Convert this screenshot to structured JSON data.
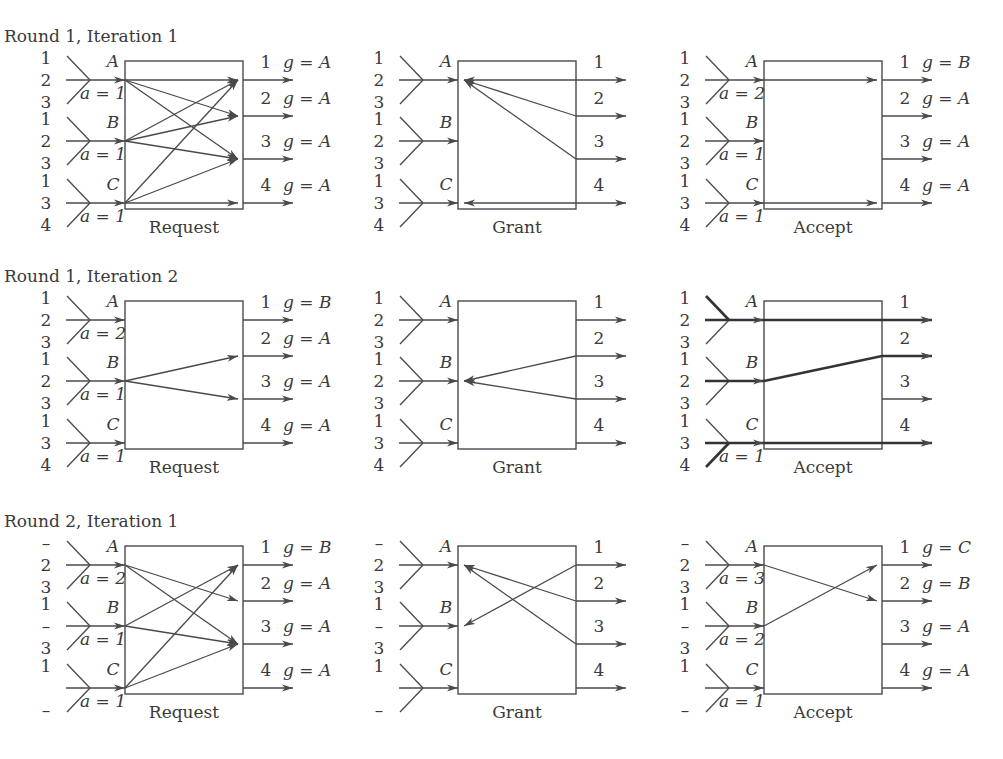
{
  "figure": {
    "colors": {
      "line": "#4a4a4a",
      "text": "#3a3a3a",
      "background": "#ffffff"
    },
    "layout": {
      "columns_x": [
        0,
        333,
        639
      ],
      "rows_y": [
        0,
        240,
        487
      ]
    },
    "rows": [
      {
        "title": "Round 1, Iteration 1",
        "panels": [
          {
            "caption": "Request",
            "inputs": [
              {
                "name": "A",
                "queues": [
                  "1",
                  "2",
                  "3"
                ],
                "a": "a = 1",
                "bold_branch": null
              },
              {
                "name": "B",
                "queues": [
                  "1",
                  "2",
                  "3"
                ],
                "a": "a = 1",
                "bold_branch": null
              },
              {
                "name": "C",
                "queues": [
                  "1",
                  "3",
                  "4"
                ],
                "a": "a = 1",
                "bold_branch": null
              }
            ],
            "outputs": [
              {
                "name": "1",
                "g": "g = A"
              },
              {
                "name": "2",
                "g": "g = A"
              },
              {
                "name": "3",
                "g": "g = A"
              },
              {
                "name": "4",
                "g": "g = A"
              }
            ],
            "edges": [
              {
                "from": "A",
                "to": "1",
                "dir": "in-out"
              },
              {
                "from": "A",
                "to": "2",
                "dir": "in-out"
              },
              {
                "from": "A",
                "to": "3",
                "dir": "in-out"
              },
              {
                "from": "B",
                "to": "1",
                "dir": "in-out"
              },
              {
                "from": "B",
                "to": "2",
                "dir": "in-out"
              },
              {
                "from": "B",
                "to": "3",
                "dir": "in-out"
              },
              {
                "from": "C",
                "to": "1",
                "dir": "in-out"
              },
              {
                "from": "C",
                "to": "3",
                "dir": "in-out"
              },
              {
                "from": "C",
                "to": "4",
                "dir": "in-out"
              }
            ]
          },
          {
            "caption": "Grant",
            "inputs": [
              {
                "name": "A",
                "queues": [
                  "1",
                  "2",
                  "3"
                ],
                "a": "",
                "bold_branch": null
              },
              {
                "name": "B",
                "queues": [
                  "1",
                  "2",
                  "3"
                ],
                "a": "",
                "bold_branch": null
              },
              {
                "name": "C",
                "queues": [
                  "1",
                  "3",
                  "4"
                ],
                "a": "",
                "bold_branch": null
              }
            ],
            "outputs": [
              {
                "name": "1",
                "g": ""
              },
              {
                "name": "2",
                "g": ""
              },
              {
                "name": "3",
                "g": ""
              },
              {
                "name": "4",
                "g": ""
              }
            ],
            "edges": [
              {
                "from": "1",
                "to": "A",
                "dir": "out-in"
              },
              {
                "from": "2",
                "to": "A",
                "dir": "out-in"
              },
              {
                "from": "3",
                "to": "A",
                "dir": "out-in"
              },
              {
                "from": "4",
                "to": "C",
                "dir": "out-in"
              }
            ]
          },
          {
            "caption": "Accept",
            "inputs": [
              {
                "name": "A",
                "queues": [
                  "1",
                  "2",
                  "3"
                ],
                "a": "a = 2",
                "bold_branch": null
              },
              {
                "name": "B",
                "queues": [
                  "1",
                  "2",
                  "3"
                ],
                "a": "a = 1",
                "bold_branch": null
              },
              {
                "name": "C",
                "queues": [
                  "1",
                  "3",
                  "4"
                ],
                "a": "a = 1",
                "bold_branch": null
              }
            ],
            "outputs": [
              {
                "name": "1",
                "g": "g = B"
              },
              {
                "name": "2",
                "g": "g = A"
              },
              {
                "name": "3",
                "g": "g = A"
              },
              {
                "name": "4",
                "g": "g = A"
              }
            ],
            "edges": [
              {
                "from": "A",
                "to": "1",
                "dir": "in-out"
              },
              {
                "from": "C",
                "to": "4",
                "dir": "in-out"
              }
            ]
          }
        ]
      },
      {
        "title": "Round 1, Iteration 2",
        "panels": [
          {
            "caption": "Request",
            "inputs": [
              {
                "name": "A",
                "queues": [
                  "1",
                  "2",
                  "3"
                ],
                "a": "a = 2",
                "bold_branch": null
              },
              {
                "name": "B",
                "queues": [
                  "1",
                  "2",
                  "3"
                ],
                "a": "a = 1",
                "bold_branch": null
              },
              {
                "name": "C",
                "queues": [
                  "1",
                  "3",
                  "4"
                ],
                "a": "a = 1",
                "bold_branch": null
              }
            ],
            "outputs": [
              {
                "name": "1",
                "g": "g = B"
              },
              {
                "name": "2",
                "g": "g = A"
              },
              {
                "name": "3",
                "g": "g = A"
              },
              {
                "name": "4",
                "g": "g = A"
              }
            ],
            "edges": [
              {
                "from": "B",
                "to": "2",
                "dir": "in-out"
              },
              {
                "from": "B",
                "to": "3",
                "dir": "in-out"
              }
            ]
          },
          {
            "caption": "Grant",
            "inputs": [
              {
                "name": "A",
                "queues": [
                  "1",
                  "2",
                  "3"
                ],
                "a": "",
                "bold_branch": null
              },
              {
                "name": "B",
                "queues": [
                  "1",
                  "2",
                  "3"
                ],
                "a": "",
                "bold_branch": null
              },
              {
                "name": "C",
                "queues": [
                  "1",
                  "3",
                  "4"
                ],
                "a": "",
                "bold_branch": null
              }
            ],
            "outputs": [
              {
                "name": "1",
                "g": ""
              },
              {
                "name": "2",
                "g": ""
              },
              {
                "name": "3",
                "g": ""
              },
              {
                "name": "4",
                "g": ""
              }
            ],
            "edges": [
              {
                "from": "2",
                "to": "B",
                "dir": "out-in"
              },
              {
                "from": "3",
                "to": "B",
                "dir": "out-in"
              }
            ]
          },
          {
            "caption": "Accept",
            "inputs": [
              {
                "name": "A",
                "queues": [
                  "1",
                  "2",
                  "3"
                ],
                "a": "",
                "bold_branch": 0
              },
              {
                "name": "B",
                "queues": [
                  "1",
                  "2",
                  "3"
                ],
                "a": "",
                "bold_branch": 1
              },
              {
                "name": "C",
                "queues": [
                  "1",
                  "3",
                  "4"
                ],
                "a": "a = 1",
                "bold_branch": 2
              }
            ],
            "outputs": [
              {
                "name": "1",
                "g": ""
              },
              {
                "name": "2",
                "g": ""
              },
              {
                "name": "3",
                "g": ""
              },
              {
                "name": "4",
                "g": ""
              }
            ],
            "edges": [
              {
                "from": "A",
                "to": "1",
                "dir": "bold"
              },
              {
                "from": "B",
                "to": "2",
                "dir": "bold"
              },
              {
                "from": "C",
                "to": "4",
                "dir": "bold"
              }
            ]
          }
        ]
      },
      {
        "title": "Round 2, Iteration 1",
        "panels": [
          {
            "caption": "Request",
            "inputs": [
              {
                "name": "A",
                "queues": [
                  "–",
                  "2",
                  "3"
                ],
                "a": "a = 2",
                "bold_branch": null
              },
              {
                "name": "B",
                "queues": [
                  "1",
                  "–",
                  "3"
                ],
                "a": "a = 1",
                "bold_branch": null
              },
              {
                "name": "C",
                "queues": [
                  "1",
                  "",
                  "–"
                ],
                "a": "a = 1",
                "bold_branch": null
              }
            ],
            "outputs": [
              {
                "name": "1",
                "g": "g = B"
              },
              {
                "name": "2",
                "g": "g = A"
              },
              {
                "name": "3",
                "g": "g = A"
              },
              {
                "name": "4",
                "g": "g = A"
              }
            ],
            "edges": [
              {
                "from": "A",
                "to": "2",
                "dir": "in-out"
              },
              {
                "from": "A",
                "to": "3",
                "dir": "in-out"
              },
              {
                "from": "B",
                "to": "1",
                "dir": "in-out"
              },
              {
                "from": "B",
                "to": "3",
                "dir": "in-out"
              },
              {
                "from": "C",
                "to": "1",
                "dir": "in-out"
              },
              {
                "from": "C",
                "to": "3",
                "dir": "in-out"
              }
            ]
          },
          {
            "caption": "Grant",
            "inputs": [
              {
                "name": "A",
                "queues": [
                  "–",
                  "2",
                  "3"
                ],
                "a": "",
                "bold_branch": null
              },
              {
                "name": "B",
                "queues": [
                  "1",
                  "–",
                  "3"
                ],
                "a": "",
                "bold_branch": null
              },
              {
                "name": "C",
                "queues": [
                  "1",
                  "",
                  "–"
                ],
                "a": "",
                "bold_branch": null
              }
            ],
            "outputs": [
              {
                "name": "1",
                "g": ""
              },
              {
                "name": "2",
                "g": ""
              },
              {
                "name": "3",
                "g": ""
              },
              {
                "name": "4",
                "g": ""
              }
            ],
            "edges": [
              {
                "from": "1",
                "to": "B",
                "dir": "out-in"
              },
              {
                "from": "2",
                "to": "A",
                "dir": "out-in"
              },
              {
                "from": "3",
                "to": "A",
                "dir": "out-in"
              }
            ]
          },
          {
            "caption": "Accept",
            "inputs": [
              {
                "name": "A",
                "queues": [
                  "–",
                  "2",
                  "3"
                ],
                "a": "a = 3",
                "bold_branch": null
              },
              {
                "name": "B",
                "queues": [
                  "1",
                  "–",
                  "3"
                ],
                "a": "a = 2",
                "bold_branch": null
              },
              {
                "name": "C",
                "queues": [
                  "1",
                  "",
                  "–"
                ],
                "a": "a = 1",
                "bold_branch": null
              }
            ],
            "outputs": [
              {
                "name": "1",
                "g": "g = C"
              },
              {
                "name": "2",
                "g": "g = B"
              },
              {
                "name": "3",
                "g": "g = A"
              },
              {
                "name": "4",
                "g": "g = A"
              }
            ],
            "edges": [
              {
                "from": "A",
                "to": "2",
                "dir": "in-out"
              },
              {
                "from": "B",
                "to": "1",
                "dir": "in-out"
              }
            ]
          }
        ]
      }
    ]
  }
}
